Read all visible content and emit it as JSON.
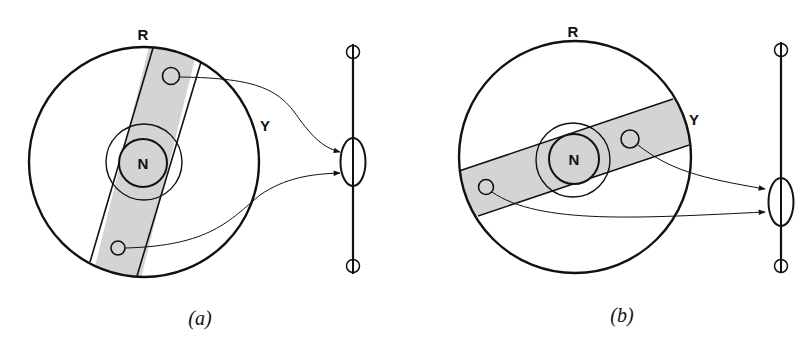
{
  "figure": {
    "panels": [
      {
        "id": "a",
        "caption": "(a)",
        "labels": {
          "top": "R",
          "right": "Y",
          "center": "N"
        },
        "band_orientation": "near-vertical",
        "band_color": "#d4d4d4"
      },
      {
        "id": "b",
        "caption": "(b)",
        "labels": {
          "top": "R",
          "right": "Y",
          "center": "N"
        },
        "band_orientation": "tilted-horizontal",
        "band_color": "#d4d4d4"
      }
    ],
    "colors": {
      "stroke": "#111111",
      "background": "#ffffff",
      "band": "#d4d4d4"
    }
  }
}
